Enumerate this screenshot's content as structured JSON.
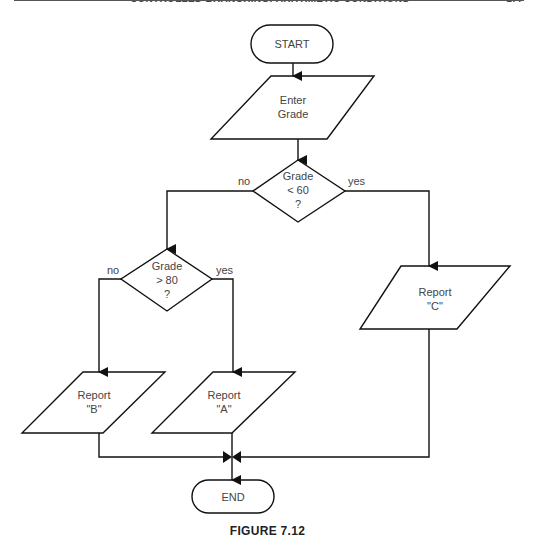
{
  "page_header": {
    "title": "CONTROLLED BRANCHING: ARITHMETIC CONDITIONS",
    "page_number": "177"
  },
  "flowchart": {
    "start": {
      "label": "START",
      "shape": "terminal"
    },
    "input": {
      "line1": "Enter",
      "line2": "Grade",
      "shape": "parallelogram"
    },
    "decision1": {
      "line1": "Grade",
      "line2": "< 60",
      "line3": "?",
      "shape": "diamond",
      "no_label": "no",
      "yes_label": "yes"
    },
    "decision2": {
      "line1": "Grade",
      "line2": "> 80",
      "line3": "?",
      "shape": "diamond",
      "no_label": "no",
      "yes_label": "yes"
    },
    "report_b": {
      "line1": "Report",
      "line2": "\"B\"",
      "shape": "parallelogram"
    },
    "report_a": {
      "line1": "Report",
      "line2": "\"A\"",
      "shape": "parallelogram"
    },
    "report_c": {
      "line1": "Report",
      "line2": "\"C\"",
      "shape": "parallelogram"
    },
    "end": {
      "label": "END",
      "shape": "terminal"
    }
  },
  "caption": "FIGURE 7.12",
  "colors": {
    "stroke": "#111111",
    "text": "#444444",
    "background": "#ffffff"
  }
}
